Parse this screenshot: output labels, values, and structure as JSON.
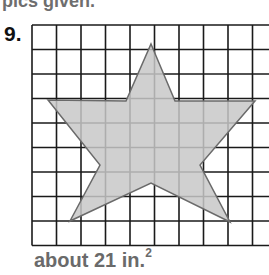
{
  "header": {
    "text_fragment": "pics given."
  },
  "problem": {
    "number": "9.",
    "figure": {
      "type": "star-on-grid",
      "grid": {
        "columns": 10,
        "rows": 9,
        "cell_px": 24.5,
        "origin_px": [
          32,
          25
        ]
      },
      "star_vertices_px": [
        [
          151,
          44
        ],
        [
          175,
          101
        ],
        [
          255,
          101
        ],
        [
          200,
          165
        ],
        [
          230,
          222
        ],
        [
          151,
          183
        ],
        [
          70,
          221
        ],
        [
          100,
          165
        ],
        [
          48,
          100
        ],
        [
          126,
          101
        ]
      ],
      "fill_color": "#c8c8c8",
      "stroke_color": "#6a6a6a",
      "grid_color": "#1a1a1a"
    },
    "answer": {
      "prefix": "about 21 in.",
      "superscript": "2"
    }
  }
}
